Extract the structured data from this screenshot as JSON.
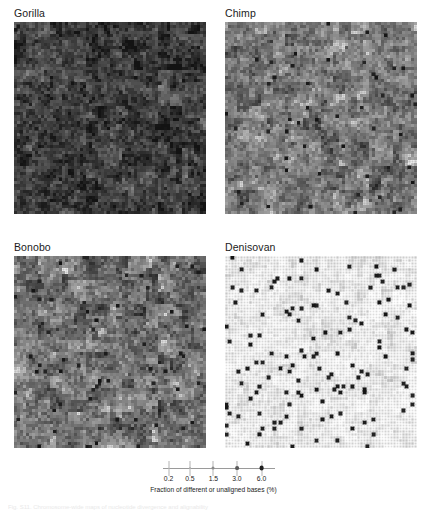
{
  "figure": {
    "type": "hilbert-curve-genome-map-grid",
    "caption_partial": "Fig. S11. Chromosome-wide maps of nucleotide divergence and alignability"
  },
  "panels": [
    {
      "id": "gorilla",
      "title": "Gorilla",
      "mean_divergence_pct": 1.75,
      "darkness": 0.82,
      "variability": 0.3,
      "outlier_rate": 0.01,
      "x": 14,
      "y": 7,
      "size": 192
    },
    {
      "id": "chimp",
      "title": "Chimp",
      "mean_divergence_pct": 1.2,
      "darkness": 0.56,
      "variability": 0.34,
      "outlier_rate": 0.012,
      "x": 225,
      "y": 7,
      "size": 192
    },
    {
      "id": "bonobo",
      "title": "Bonobo",
      "mean_divergence_pct": 1.25,
      "darkness": 0.6,
      "variability": 0.36,
      "outlier_rate": 0.014,
      "x": 14,
      "y": 241,
      "size": 192
    },
    {
      "id": "denisovan",
      "title": "Denisovan",
      "mean_divergence_pct": 0.35,
      "darkness": 0.2,
      "variability": 0.12,
      "outlier_rate": 0.03,
      "x": 225,
      "y": 241,
      "size": 192
    }
  ],
  "legend": {
    "caption": "Fraction of different or unaligned bases (%)",
    "ticks": [
      {
        "label": "0.2",
        "value": 0.2,
        "pos_pct": 5,
        "dot_px": 1.4,
        "gray": "#c9c9c9"
      },
      {
        "label": "0.5",
        "value": 0.5,
        "pos_pct": 24,
        "dot_px": 2.0,
        "gray": "#b0b0b0"
      },
      {
        "label": "1.5",
        "value": 1.5,
        "pos_pct": 45,
        "dot_px": 3.0,
        "gray": "#8a8a8a"
      },
      {
        "label": "3.0",
        "value": 3.0,
        "pos_pct": 66,
        "dot_px": 3.8,
        "gray": "#5a5a5a"
      },
      {
        "label": "6.0",
        "value": 6.0,
        "pos_pct": 88,
        "dot_px": 4.8,
        "gray": "#1f1f1f"
      }
    ]
  },
  "chart_data": {
    "type": "heatmap",
    "title": "",
    "encoding": "Hilbert space-filling curve; each cell is a genomic window. Dot size and darkness encode the fraction of different or unaligned bases (%).",
    "xlabel": "",
    "ylabel": "",
    "legend_label": "Fraction of different or unaligned bases (%)",
    "legend_position": "bottom",
    "grid": false,
    "scale_ticks": [
      0.2,
      0.5,
      1.5,
      3.0,
      6.0
    ],
    "scale_min": 0.2,
    "scale_max": 6.0,
    "series": [
      {
        "name": "Gorilla",
        "mean_value": 1.75,
        "units": "%"
      },
      {
        "name": "Chimp",
        "mean_value": 1.2,
        "units": "%"
      },
      {
        "name": "Bonobo",
        "mean_value": 1.25,
        "units": "%"
      },
      {
        "name": "Denisovan",
        "mean_value": 0.35,
        "units": "%"
      }
    ],
    "categories": [
      "Gorilla",
      "Chimp",
      "Bonobo",
      "Denisovan"
    ],
    "values": [
      1.75,
      1.2,
      1.25,
      0.35
    ]
  }
}
